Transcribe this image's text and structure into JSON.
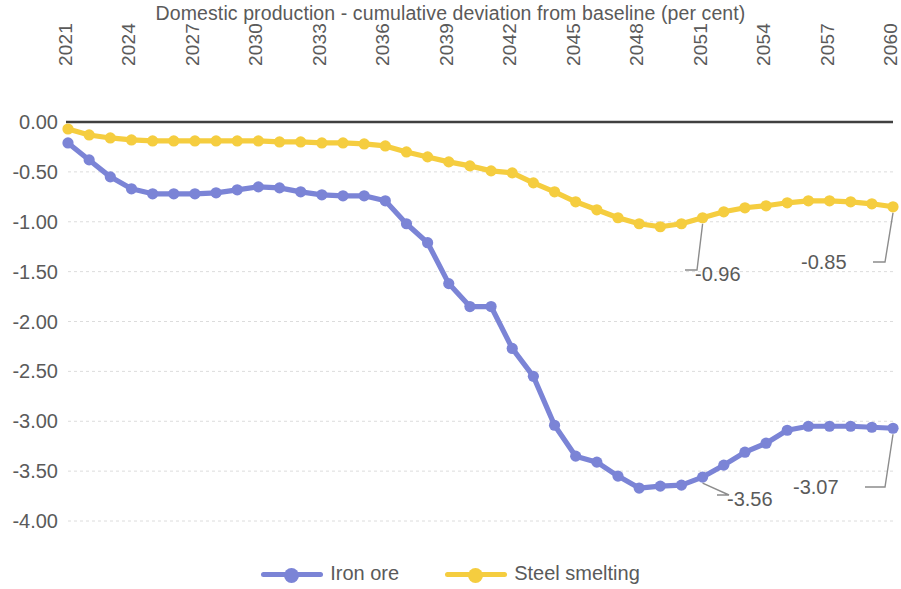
{
  "chart_data": {
    "type": "line",
    "title": "Domestic production - cumulative deviation from baseline (per cent)",
    "xlabel": "",
    "ylabel": "",
    "ylim": [
      -4.0,
      0.0
    ],
    "ytick_labels": [
      "0.00",
      "-0.50",
      "-1.00",
      "-1.50",
      "-2.00",
      "-2.50",
      "-3.00",
      "-3.50",
      "-4.00"
    ],
    "ytick_values": [
      0,
      -0.5,
      -1.0,
      -1.5,
      -2.0,
      -2.5,
      -3.0,
      -3.5,
      -4.0
    ],
    "grid": true,
    "legend_position": "bottom",
    "x": [
      2021,
      2022,
      2023,
      2024,
      2025,
      2026,
      2027,
      2028,
      2029,
      2030,
      2031,
      2032,
      2033,
      2034,
      2035,
      2036,
      2037,
      2038,
      2039,
      2040,
      2041,
      2042,
      2043,
      2044,
      2045,
      2046,
      2047,
      2048,
      2049,
      2050,
      2051,
      2052,
      2053,
      2054,
      2055,
      2056,
      2057,
      2058,
      2059,
      2060
    ],
    "xtick_labels": [
      "2021",
      "2024",
      "2027",
      "2030",
      "2033",
      "2036",
      "2039",
      "2042",
      "2045",
      "2048",
      "2051",
      "2054",
      "2057",
      "2060"
    ],
    "series": [
      {
        "name": "Iron ore",
        "color": "#7b84d6",
        "values": [
          -0.21,
          -0.38,
          -0.55,
          -0.67,
          -0.72,
          -0.72,
          -0.72,
          -0.71,
          -0.68,
          -0.65,
          -0.66,
          -0.7,
          -0.73,
          -0.74,
          -0.74,
          -0.79,
          -1.02,
          -1.21,
          -1.62,
          -1.85,
          -1.85,
          -2.27,
          -2.55,
          -3.04,
          -3.35,
          -3.41,
          -3.55,
          -3.67,
          -3.65,
          -3.64,
          -3.56,
          -3.44,
          -3.31,
          -3.22,
          -3.09,
          -3.05,
          -3.05,
          -3.05,
          -3.06,
          -3.07
        ]
      },
      {
        "name": "Steel smelting",
        "color": "#f5cd3f",
        "values": [
          -0.07,
          -0.13,
          -0.16,
          -0.18,
          -0.19,
          -0.19,
          -0.19,
          -0.19,
          -0.19,
          -0.19,
          -0.2,
          -0.2,
          -0.21,
          -0.21,
          -0.22,
          -0.24,
          -0.3,
          -0.35,
          -0.4,
          -0.44,
          -0.49,
          -0.51,
          -0.61,
          -0.7,
          -0.8,
          -0.88,
          -0.96,
          -1.02,
          -1.05,
          -1.02,
          -0.96,
          -0.9,
          -0.86,
          -0.84,
          -0.81,
          -0.79,
          -0.79,
          -0.8,
          -0.82,
          -0.85
        ]
      }
    ],
    "annotations": [
      {
        "text": "-0.96",
        "series": "Steel smelting",
        "x": 2051,
        "value": -0.96
      },
      {
        "text": "-0.85",
        "series": "Steel smelting",
        "x": 2060,
        "value": -0.85
      },
      {
        "text": "-3.56",
        "series": "Iron ore",
        "x": 2051,
        "value": -3.56
      },
      {
        "text": "-3.07",
        "series": "Iron ore",
        "x": 2060,
        "value": -3.07
      }
    ]
  },
  "legend": {
    "items": [
      {
        "label": "Iron ore"
      },
      {
        "label": "Steel smelting"
      }
    ]
  }
}
